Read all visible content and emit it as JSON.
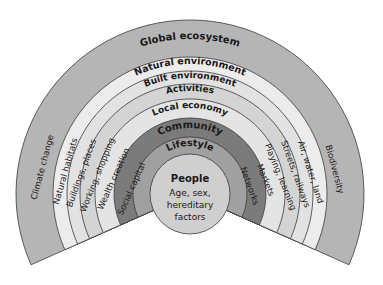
{
  "diagram": {
    "type": "health-map-rainbow",
    "center": {
      "title": "People",
      "lines": [
        "Age, sex,",
        "hereditary",
        "factors"
      ]
    },
    "rings": [
      {
        "name": "Global ecosystem",
        "left": "Climate change",
        "right": "Biodiversity",
        "color": "#b5b5b5"
      },
      {
        "name": "Natural environment",
        "left": "Natural habitats",
        "right": "Air, water, land",
        "color": "#ececec"
      },
      {
        "name": "Built environment",
        "left": "Buildings, places",
        "right": "Streets, railways",
        "color": "#e2e2e2"
      },
      {
        "name": "Activities",
        "left": "Working, shopping",
        "right": "Playing, learning",
        "color": "#d4d4d4"
      },
      {
        "name": "Local economy",
        "left": "Wealth creation",
        "right": "Markets",
        "color": "#e4e4e4"
      },
      {
        "name": "Community",
        "left": "Social capital",
        "right": "Networks",
        "color": "#7b7b7b"
      },
      {
        "name": "Lifestyle",
        "left": "",
        "right": "",
        "color": "#a0a0a0"
      }
    ],
    "people_color": "#cfcfcf",
    "line_color": "#3a3a3a"
  }
}
